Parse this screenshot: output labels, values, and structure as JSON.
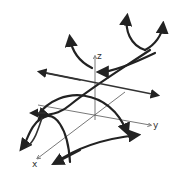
{
  "diagram": {
    "axes": {
      "x_label": "x",
      "y_label": "y",
      "z_label": "z"
    },
    "colors": {
      "ink": "#222222",
      "axis": "#555555",
      "background": "#ffffff"
    }
  }
}
